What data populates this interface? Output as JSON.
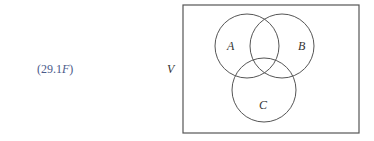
{
  "equation_label": {
    "prefix": "(29.1",
    "italic": "F",
    "suffix": ")"
  },
  "universe_label": "V",
  "sets": [
    {
      "name": "A",
      "cx": 247,
      "cy": 46,
      "r": 32,
      "label_x": 227,
      "label_y": 50
    },
    {
      "name": "B",
      "cx": 282,
      "cy": 46,
      "r": 32,
      "label_x": 298,
      "label_y": 50
    },
    {
      "name": "C",
      "cx": 264,
      "cy": 90,
      "r": 32,
      "label_x": 259,
      "label_y": 109
    }
  ],
  "universe_box": {
    "x": 183,
    "y": 5,
    "width": 176,
    "height": 128
  },
  "colors": {
    "stroke": "#555555",
    "equation": "#4a5a8a"
  }
}
